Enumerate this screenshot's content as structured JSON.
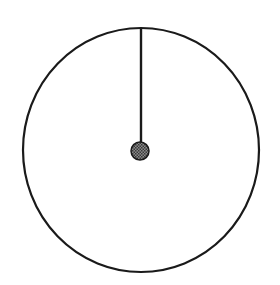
{
  "diagram": {
    "type": "clock-dial",
    "colors": {
      "background": "#ffffff",
      "stroke": "#1a1a1a",
      "hub_fill": "#5a5a5a"
    },
    "outer_circle": {
      "cx": 141,
      "cy": 150,
      "rx": 118,
      "ry": 122,
      "stroke_width": 2.2
    },
    "hand": {
      "x": 141,
      "y1": 28,
      "y2": 148,
      "stroke_width": 2.4,
      "direction": "12 o'clock"
    },
    "hub": {
      "cx": 140,
      "cy": 151,
      "r": 9
    }
  }
}
